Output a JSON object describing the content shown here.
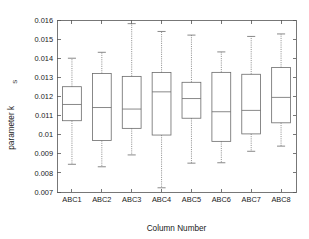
{
  "chart_data": {
    "type": "box",
    "title": "",
    "xlabel": "Column Number",
    "ylabel": "parameter k",
    "ylabel_sub": "S",
    "categories": [
      "ABC1",
      "ABC2",
      "ABC3",
      "ABC4",
      "ABC5",
      "ABC6",
      "ABC7",
      "ABC8"
    ],
    "ylim": [
      0.007,
      0.016
    ],
    "ytick_labels": [
      "0.016",
      "0.015",
      "0.014",
      "0.013",
      "0.012",
      "0.011",
      "0.01",
      "0.009",
      "0.008",
      "0.007"
    ],
    "ytick_values": [
      0.016,
      0.015,
      0.014,
      0.013,
      0.012,
      0.011,
      0.01,
      0.009,
      0.008,
      0.007
    ],
    "grid": false,
    "legend": "none",
    "line_color": "#6b6b6b",
    "boxes": [
      {
        "label": "ABC1",
        "whisker_low": 0.00845,
        "q1": 0.01073,
        "median": 0.01158,
        "q3": 0.01251,
        "whisker_high": 0.014
      },
      {
        "label": "ABC2",
        "whisker_low": 0.00832,
        "q1": 0.00969,
        "median": 0.01142,
        "q3": 0.0132,
        "whisker_high": 0.01431
      },
      {
        "label": "ABC3",
        "whisker_low": 0.00894,
        "q1": 0.01033,
        "median": 0.01134,
        "q3": 0.01305,
        "whisker_high": 0.01581
      },
      {
        "label": "ABC4",
        "whisker_low": 0.00722,
        "q1": 0.00998,
        "median": 0.01224,
        "q3": 0.01325,
        "whisker_high": 0.0154
      },
      {
        "label": "ABC5",
        "whisker_low": 0.00851,
        "q1": 0.01086,
        "median": 0.01189,
        "q3": 0.01274,
        "whisker_high": 0.01521
      },
      {
        "label": "ABC6",
        "whisker_low": 0.00853,
        "q1": 0.00965,
        "median": 0.0112,
        "q3": 0.01326,
        "whisker_high": 0.01433
      },
      {
        "label": "ABC7",
        "whisker_low": 0.00913,
        "q1": 0.01004,
        "median": 0.01127,
        "q3": 0.01316,
        "whisker_high": 0.01514
      },
      {
        "label": "ABC8",
        "whisker_low": 0.0094,
        "q1": 0.01062,
        "median": 0.01195,
        "q3": 0.01351,
        "whisker_high": 0.01527
      }
    ]
  },
  "plot_geometry": {
    "left": 57,
    "right": 296,
    "top": 20,
    "bottom": 192
  }
}
